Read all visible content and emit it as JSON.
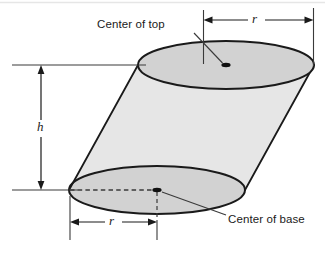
{
  "figure": {
    "kind": "oblique-cylinder-geometry-diagram",
    "background_color": "#ffffff",
    "stroke_color": "#1a1a1a",
    "face_fill_color": "#d2d2d2",
    "thin_line_color": "#555555",
    "labels": {
      "center_of_top": "Center of top",
      "center_of_base": "Center of base",
      "height": "h",
      "radius_top": "r",
      "radius_base": "r"
    },
    "geometry": {
      "top_ellipse": {
        "cx": 226,
        "cy": 65,
        "rx": 88,
        "ry": 24
      },
      "base_ellipse": {
        "cx": 157,
        "cy": 190,
        "rx": 88,
        "ry": 24
      },
      "top_center_dot": {
        "x": 226,
        "y": 65
      },
      "base_center_dot": {
        "x": 157,
        "y": 190
      }
    },
    "dimensions": {
      "top_radius": {
        "from_x": 203,
        "to_x": 313,
        "y": 20,
        "label": "r"
      },
      "base_radius": {
        "from_x": 70,
        "to_x": 157,
        "y": 222,
        "label": "r"
      },
      "height": {
        "x": 41,
        "from_y": 65,
        "to_y": 190,
        "label": "h"
      }
    },
    "leaders": [
      {
        "name": "top-leader",
        "from_x": 194,
        "from_y": 34,
        "to_x": 222,
        "to_y": 63
      },
      {
        "name": "base-leader",
        "from_x": 224,
        "from_y": 216,
        "to_x": 162,
        "to_y": 192
      }
    ]
  }
}
